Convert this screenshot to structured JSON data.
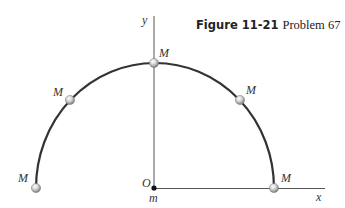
{
  "caption": {
    "figure_label": "Figure 11-21",
    "problem_label": "Problem 67"
  },
  "axes": {
    "x_label": "x",
    "y_label": "y",
    "origin_label": "O",
    "origin_mass_label": "m"
  },
  "masses": [
    {
      "label": "M",
      "angle_deg": 180
    },
    {
      "label": "M",
      "angle_deg": 135
    },
    {
      "label": "M",
      "angle_deg": 90
    },
    {
      "label": "M",
      "angle_deg": 45
    },
    {
      "label": "M",
      "angle_deg": 0
    }
  ],
  "colors": {
    "arc": "#333333",
    "axis": "#555555",
    "bead_light": "#f2f2f2",
    "bead_dark": "#8a8a8a",
    "origin_dot": "#111111"
  }
}
